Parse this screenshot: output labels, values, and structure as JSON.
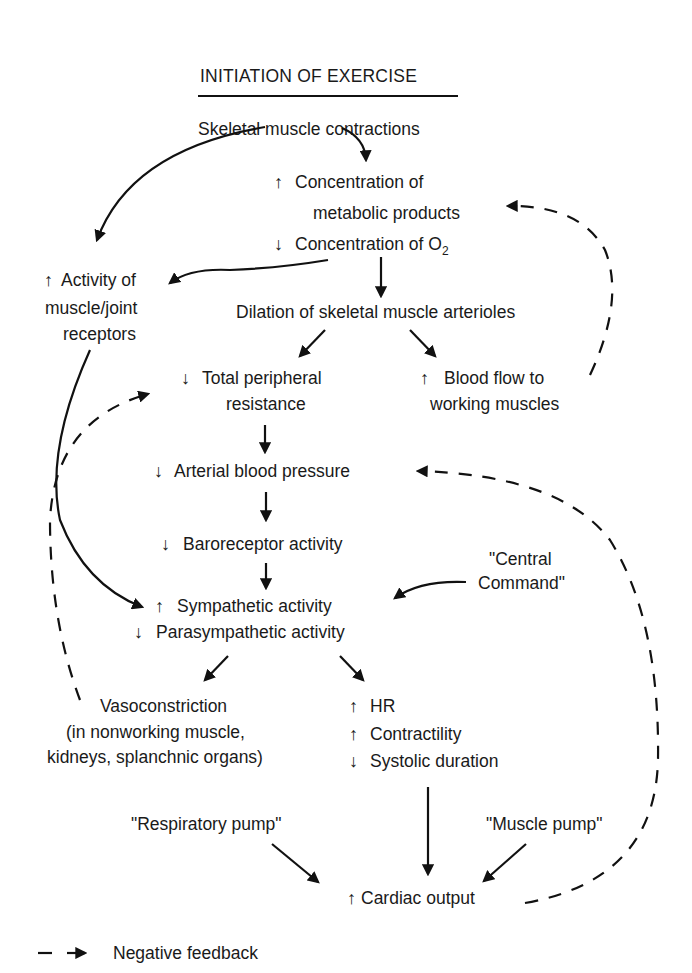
{
  "title": "INITIATION OF EXERCISE",
  "nodes": {
    "skeletal_contractions": "Skeletal muscle contractions",
    "metabolic_line1": "Concentration of",
    "metabolic_line2": "metabolic products",
    "o2_line": "Concentration of O",
    "o2_subscript": "2",
    "receptors_line1": "Activity of",
    "receptors_line2": "muscle/joint",
    "receptors_line3": "receptors",
    "dilation": "Dilation of skeletal muscle arterioles",
    "tpr_line1": "Total peripheral",
    "tpr_line2": "resistance",
    "bloodflow_line1": "Blood flow to",
    "bloodflow_line2": "working muscles",
    "arterial_bp": "Arterial blood pressure",
    "baroreceptor": "Baroreceptor activity",
    "central_command_line1": "\"Central",
    "central_command_line2": "Command\"",
    "sympathetic": "Sympathetic activity",
    "parasympathetic": "Parasympathetic activity",
    "vasoconstriction_line1": "Vasoconstriction",
    "vasoconstriction_line2": "(in nonworking muscle,",
    "vasoconstriction_line3": "kidneys, splanchnic organs)",
    "hr": "HR",
    "contractility": "Contractility",
    "systolic_duration": "Systolic duration",
    "respiratory_pump": "\"Respiratory pump\"",
    "muscle_pump": "\"Muscle pump\"",
    "cardiac_output": "Cardiac output"
  },
  "symbols": {
    "up": "↑",
    "down": "↓"
  },
  "legend": {
    "label": "Negative feedback",
    "line_style": "dashed-arrow"
  },
  "colors": {
    "ink": "#111111",
    "background": "#ffffff"
  }
}
